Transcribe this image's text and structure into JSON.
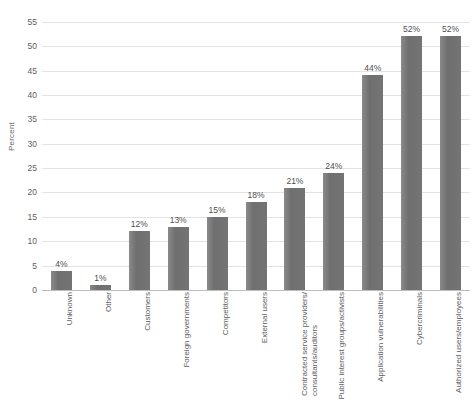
{
  "chart_data": {
    "type": "bar",
    "title": "",
    "subtitle": "",
    "xlabel": "",
    "ylabel": "Percent",
    "ylim": [
      0,
      57
    ],
    "yticks": [
      0,
      5,
      10,
      15,
      20,
      25,
      30,
      35,
      40,
      45,
      50,
      55
    ],
    "grid": true,
    "legend": "none",
    "value_suffix": "%",
    "bar_color": "#757575",
    "categories": [
      "Unknown",
      "Other",
      "Customers",
      "Foreign governments",
      "Competitors",
      "External users",
      "Contracted service providers/ consultants/auditors",
      "Public interest groups/activists",
      "Application vulnerabilities",
      "Cybercriminals",
      "Authorized users/employees"
    ],
    "category_lines": [
      [
        "Unknown"
      ],
      [
        "Other"
      ],
      [
        "Customers"
      ],
      [
        "Foreign governments"
      ],
      [
        "Competitors"
      ],
      [
        "External users"
      ],
      [
        "Contracted service providers/",
        "consultants/auditors"
      ],
      [
        "Public interest groups/activists"
      ],
      [
        "Application vulnerabilities"
      ],
      [
        "Cybercriminals"
      ],
      [
        "Authorized users/employees"
      ]
    ],
    "values": [
      4,
      1,
      12,
      13,
      15,
      18,
      21,
      24,
      44,
      52,
      52
    ],
    "value_labels": [
      "4%",
      "1%",
      "12%",
      "13%",
      "15%",
      "18%",
      "21%",
      "24%",
      "44%",
      "52%",
      "52%"
    ]
  }
}
